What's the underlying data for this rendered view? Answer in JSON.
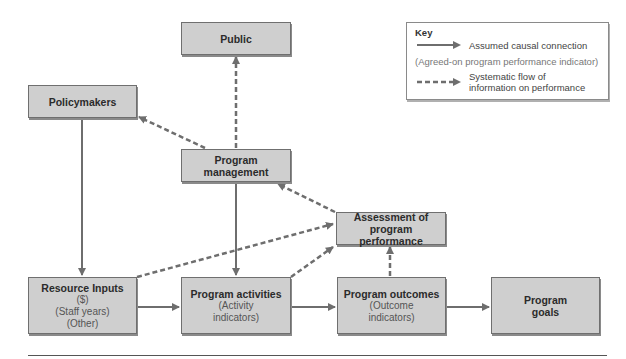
{
  "diagram": {
    "nodes": {
      "public": {
        "title": "Public"
      },
      "policymakers": {
        "title": "Policymakers"
      },
      "management": {
        "title": "Program",
        "title2": "management"
      },
      "assessment": {
        "title": "Assessment of",
        "title2": "program performance"
      },
      "inputs": {
        "title": "Resource Inputs",
        "sub1": "($)",
        "sub2": "(Staff years)",
        "sub3": "(Other)"
      },
      "activities": {
        "title": "Program activities",
        "sub1": "(Activity",
        "sub2": "indicators)"
      },
      "outcomes": {
        "title": "Program outcomes",
        "sub1": "(Outcome",
        "sub2": "indicators)"
      },
      "goals": {
        "title": "Program",
        "title2": "goals"
      }
    },
    "edges": [
      {
        "from": "policymakers",
        "to": "inputs",
        "style": "solid"
      },
      {
        "from": "management",
        "to": "activities",
        "style": "solid"
      },
      {
        "from": "inputs",
        "to": "activities",
        "style": "solid"
      },
      {
        "from": "activities",
        "to": "outcomes",
        "style": "solid"
      },
      {
        "from": "outcomes",
        "to": "goals",
        "style": "solid"
      },
      {
        "from": "management",
        "to": "public",
        "style": "dashed"
      },
      {
        "from": "management",
        "to": "policymakers",
        "style": "dashed"
      },
      {
        "from": "assessment",
        "to": "management",
        "style": "dashed"
      },
      {
        "from": "inputs",
        "to": "assessment",
        "style": "dashed"
      },
      {
        "from": "activities",
        "to": "assessment",
        "style": "dashed"
      },
      {
        "from": "outcomes",
        "to": "assessment",
        "style": "dashed"
      }
    ],
    "colors": {
      "box_fill": "#cfcfcf",
      "arrow": "#6e6e6e"
    }
  },
  "key": {
    "title": "Key",
    "solid_label": "Assumed causal connection",
    "paren_label": "(Agreed-on program performance indicator)",
    "dashed_label_1": "Systematic flow of",
    "dashed_label_2": "information on performance"
  }
}
